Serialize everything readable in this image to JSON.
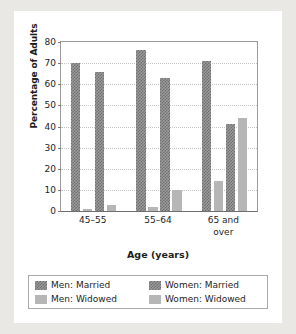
{
  "chart_data": {
    "type": "bar",
    "title": "",
    "xlabel": "Age (years)",
    "ylabel": "Percentage of Adults",
    "ylim": [
      0,
      80
    ],
    "yticks": [
      0,
      10,
      20,
      30,
      40,
      50,
      60,
      70,
      80
    ],
    "grid": true,
    "legend_position": "bottom",
    "categories": [
      "45–55",
      "55–64",
      "65 and over"
    ],
    "category_lines": [
      [
        "45–55"
      ],
      [
        "55–64"
      ],
      [
        "65 and",
        "over"
      ]
    ],
    "series": [
      {
        "name": "Men: Married",
        "pattern": "checker",
        "color": "#7d7d7d",
        "values": [
          70,
          76,
          71
        ]
      },
      {
        "name": "Men: Widowed",
        "pattern": "solid",
        "color": "#b6b6b6",
        "values": [
          1,
          2,
          14
        ]
      },
      {
        "name": "Women: Married",
        "pattern": "checker",
        "color": "#7d7d7d",
        "values": [
          66,
          63,
          41
        ]
      },
      {
        "name": "Women: Widowed",
        "pattern": "solid",
        "color": "#b6b6b6",
        "values": [
          3,
          10,
          44
        ]
      }
    ]
  },
  "legend": {
    "items": [
      {
        "label": "Men: Married",
        "pattern": "checker"
      },
      {
        "label": "Women: Married",
        "pattern": "checker"
      },
      {
        "label": "Men: Widowed",
        "pattern": "solid"
      },
      {
        "label": "Women: Widowed",
        "pattern": "solid"
      }
    ]
  },
  "axis": {
    "y_title": "Percentage of Adults",
    "x_title": "Age (years)",
    "y_tick_labels": [
      "0",
      "10",
      "20",
      "30",
      "40",
      "50",
      "60",
      "70",
      "80"
    ]
  }
}
